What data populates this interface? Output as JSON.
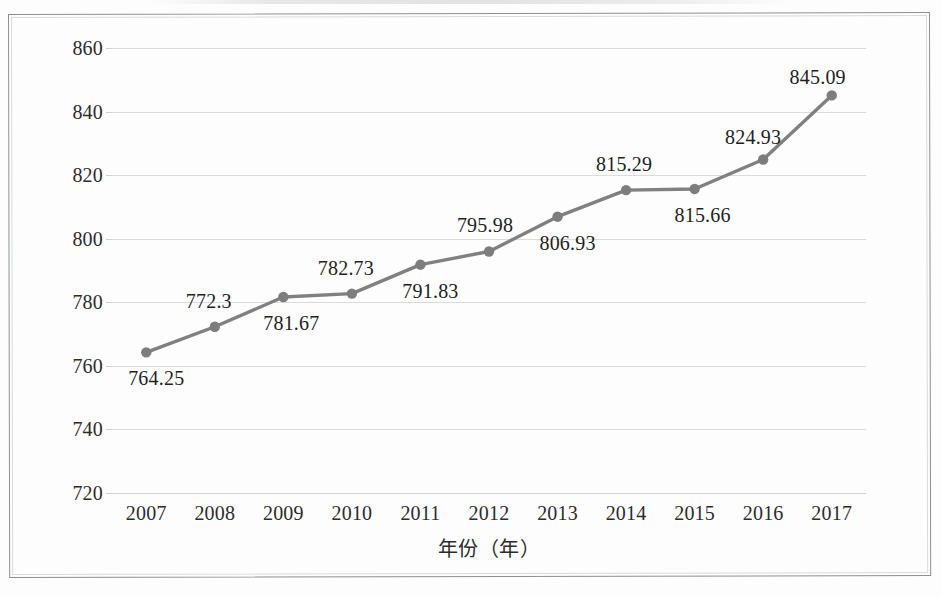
{
  "figure": {
    "axis_x_title": "年份（年）",
    "line_color": "#808080",
    "marker_color": "#7d7d7d",
    "grid_color": "#d9dbdd",
    "text_color": "#2c2c2c"
  },
  "chart_data": {
    "type": "line",
    "title": "",
    "subtitle": "",
    "xlabel": "年份（年）",
    "ylabel": "",
    "categories": [
      "2007",
      "2008",
      "2009",
      "2010",
      "2011",
      "2012",
      "2013",
      "2014",
      "2015",
      "2016",
      "2017"
    ],
    "values": [
      764.25,
      772.3,
      781.67,
      782.73,
      791.83,
      795.98,
      806.93,
      815.29,
      815.66,
      824.93,
      845.09
    ],
    "point_labels": [
      "764.25",
      "772.3",
      "781.67",
      "782.73",
      "791.83",
      "795.98",
      "806.93",
      "815.29",
      "815.66",
      "824.93",
      "845.09"
    ],
    "label_placement": [
      "below",
      "above",
      "below",
      "above",
      "below",
      "above",
      "below",
      "above",
      "below",
      "above",
      "above"
    ],
    "ylim": [
      720,
      860
    ],
    "ytick_values": [
      720,
      740,
      760,
      780,
      800,
      820,
      840,
      860
    ],
    "ytick_labels": [
      "720",
      "740",
      "760",
      "780",
      "800",
      "820",
      "840",
      "860"
    ],
    "xtick_labels": [
      "2007",
      "2008",
      "2009",
      "2010",
      "2011",
      "2012",
      "2013",
      "2014",
      "2015",
      "2016",
      "2017"
    ],
    "grid": "horizontal-only",
    "legend": "none",
    "series": [
      {
        "name": "",
        "values": [
          764.25,
          772.3,
          781.67,
          782.73,
          791.83,
          795.98,
          806.93,
          815.29,
          815.66,
          824.93,
          845.09
        ]
      }
    ]
  }
}
